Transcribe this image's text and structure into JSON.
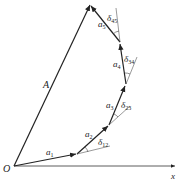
{
  "diagram": {
    "origin_label": "O",
    "x_axis_label": "x",
    "resultant_label": "A",
    "vectors": [
      {
        "label": "a",
        "sub": "1"
      },
      {
        "label": "a",
        "sub": "2"
      },
      {
        "label": "a",
        "sub": "3"
      },
      {
        "label": "a",
        "sub": "4"
      },
      {
        "label": "a",
        "sub": "5"
      }
    ],
    "angles": [
      {
        "label": "δ",
        "sub": "12"
      },
      {
        "label": "δ",
        "sub": "23"
      },
      {
        "label": "δ",
        "sub": "34"
      },
      {
        "label": "δ",
        "sub": "45"
      }
    ]
  }
}
